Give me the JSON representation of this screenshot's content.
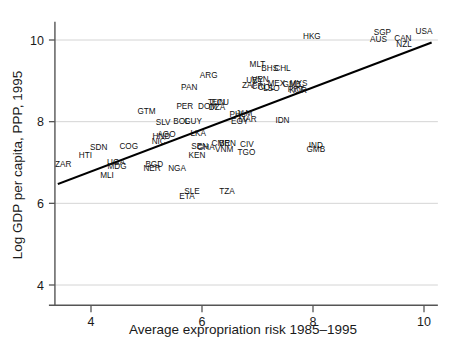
{
  "chart_data": {
    "type": "scatter",
    "title": "",
    "xlabel": "Average expropriation risk 1985–1995",
    "ylabel": "Log GDP per capita, PPP, 1995",
    "xlim": [
      3.35,
      10.25
    ],
    "ylim": [
      3.7,
      10.45
    ],
    "xticks": [
      4,
      6,
      8,
      10
    ],
    "yticks": [
      4,
      6,
      8,
      10
    ],
    "xticklabels": [
      "4",
      "6",
      "8",
      "10"
    ],
    "yticklabels": [
      "4",
      "6",
      "8",
      "10"
    ],
    "grid": "horizontal gridlines at y = 4, 6, 8, 10",
    "legend": "none",
    "point_style": "country ISO3 code text labels (no marker symbols)",
    "fit_line": {
      "label": "OLS regression line",
      "x": [
        3.42,
        10.12
      ],
      "y": [
        6.48,
        9.93
      ]
    },
    "points": [
      {
        "label": "ZAR",
        "x": 3.5,
        "y": 6.88
      },
      {
        "label": "HTI",
        "x": 3.9,
        "y": 7.12
      },
      {
        "label": "SDN",
        "x": 4.14,
        "y": 7.3
      },
      {
        "label": "MLI",
        "x": 4.29,
        "y": 6.61
      },
      {
        "label": "UGA",
        "x": 4.45,
        "y": 6.94
      },
      {
        "label": "MDG",
        "x": 4.47,
        "y": 6.84
      },
      {
        "label": "COG",
        "x": 4.68,
        "y": 7.32
      },
      {
        "label": "NER",
        "x": 5.1,
        "y": 6.78
      },
      {
        "label": "BGD",
        "x": 5.14,
        "y": 6.9
      },
      {
        "label": "NIC",
        "x": 5.22,
        "y": 7.45
      },
      {
        "label": "HND",
        "x": 5.27,
        "y": 7.58
      },
      {
        "label": "AGO",
        "x": 5.36,
        "y": 7.62
      },
      {
        "label": "SLV",
        "x": 5.3,
        "y": 7.93
      },
      {
        "label": "GTM",
        "x": 5.0,
        "y": 8.2
      },
      {
        "label": "NGA",
        "x": 5.55,
        "y": 6.8
      },
      {
        "label": "BOL",
        "x": 5.63,
        "y": 7.95
      },
      {
        "label": "GUY",
        "x": 5.84,
        "y": 7.95
      },
      {
        "label": "LKA",
        "x": 5.93,
        "y": 7.65
      },
      {
        "label": "ETA",
        "x": 5.73,
        "y": 6.1
      },
      {
        "label": "SLE",
        "x": 5.82,
        "y": 6.22
      },
      {
        "label": "KEN",
        "x": 5.91,
        "y": 7.1
      },
      {
        "label": "SEN",
        "x": 5.96,
        "y": 7.32
      },
      {
        "label": "GHA",
        "x": 6.07,
        "y": 7.3
      },
      {
        "label": "PER",
        "x": 5.69,
        "y": 8.32
      },
      {
        "label": "PAN",
        "x": 5.77,
        "y": 8.78
      },
      {
        "label": "ARG",
        "x": 6.12,
        "y": 9.08
      },
      {
        "label": "DOM",
        "x": 6.1,
        "y": 8.3
      },
      {
        "label": "DZA",
        "x": 6.27,
        "y": 8.28
      },
      {
        "label": "TUN",
        "x": 6.26,
        "y": 8.4
      },
      {
        "label": "ECU",
        "x": 6.33,
        "y": 8.42
      },
      {
        "label": "CMR",
        "x": 6.34,
        "y": 7.4
      },
      {
        "label": "BEN",
        "x": 6.46,
        "y": 7.4
      },
      {
        "label": "VNM",
        "x": 6.4,
        "y": 7.25
      },
      {
        "label": "TZA",
        "x": 6.45,
        "y": 6.22
      },
      {
        "label": "PHL",
        "x": 6.64,
        "y": 8.12
      },
      {
        "label": "JAM",
        "x": 6.76,
        "y": 8.14
      },
      {
        "label": "EGY",
        "x": 6.68,
        "y": 7.95
      },
      {
        "label": "MAR",
        "x": 6.82,
        "y": 7.98
      },
      {
        "label": "CIV",
        "x": 6.81,
        "y": 7.38
      },
      {
        "label": "TGO",
        "x": 6.8,
        "y": 7.18
      },
      {
        "label": "ZAF",
        "x": 6.86,
        "y": 8.82
      },
      {
        "label": "URY",
        "x": 6.95,
        "y": 8.95
      },
      {
        "label": "VEN",
        "x": 7.05,
        "y": 8.97
      },
      {
        "label": "CRI",
        "x": 7.02,
        "y": 8.8
      },
      {
        "label": "COL",
        "x": 7.16,
        "y": 8.78
      },
      {
        "label": "LSO",
        "x": 7.25,
        "y": 8.75
      },
      {
        "label": "MLT",
        "x": 7.0,
        "y": 9.35
      },
      {
        "label": "BHS",
        "x": 7.22,
        "y": 9.24
      },
      {
        "label": "CHL",
        "x": 7.45,
        "y": 9.25
      },
      {
        "label": "MEX",
        "x": 7.34,
        "y": 8.88
      },
      {
        "label": "IDN",
        "x": 7.45,
        "y": 7.96
      },
      {
        "label": "GMB",
        "x": 7.62,
        "y": 8.86
      },
      {
        "label": "MYS",
        "x": 7.74,
        "y": 8.87
      },
      {
        "label": "PRT",
        "x": 7.69,
        "y": 8.72
      },
      {
        "label": "KOR",
        "x": 7.73,
        "y": 8.7
      },
      {
        "label": "HKG",
        "x": 7.98,
        "y": 10.02
      },
      {
        "label": "IND",
        "x": 8.05,
        "y": 7.36
      },
      {
        "label": "GMB2",
        "x": 8.05,
        "y": 7.26
      },
      {
        "label": "SGP",
        "x": 9.25,
        "y": 10.12
      },
      {
        "label": "AUS",
        "x": 9.18,
        "y": 9.94
      },
      {
        "label": "CAN",
        "x": 9.62,
        "y": 9.98
      },
      {
        "label": "NZL",
        "x": 9.64,
        "y": 9.84
      },
      {
        "label": "USA",
        "x": 10.0,
        "y": 10.15
      }
    ]
  }
}
